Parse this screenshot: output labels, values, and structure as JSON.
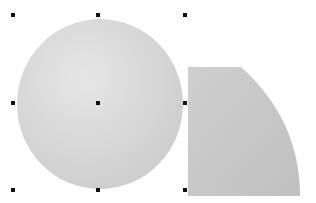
{
  "canvas": {
    "background": "#ffffff",
    "shapes": [
      {
        "name": "circle",
        "fill_light": "#e2e2e2",
        "fill_dark": "#c9c9c9",
        "selected": true
      },
      {
        "name": "quarter-shape",
        "fill": "#c8c8c8",
        "selected": false
      }
    ],
    "selection_handles": [
      {
        "x": 13,
        "y": 15
      },
      {
        "x": 98,
        "y": 15
      },
      {
        "x": 185,
        "y": 15
      },
      {
        "x": 13,
        "y": 103
      },
      {
        "x": 98,
        "y": 103
      },
      {
        "x": 185,
        "y": 103
      },
      {
        "x": 13,
        "y": 190
      },
      {
        "x": 98,
        "y": 190
      },
      {
        "x": 185,
        "y": 190
      }
    ]
  }
}
